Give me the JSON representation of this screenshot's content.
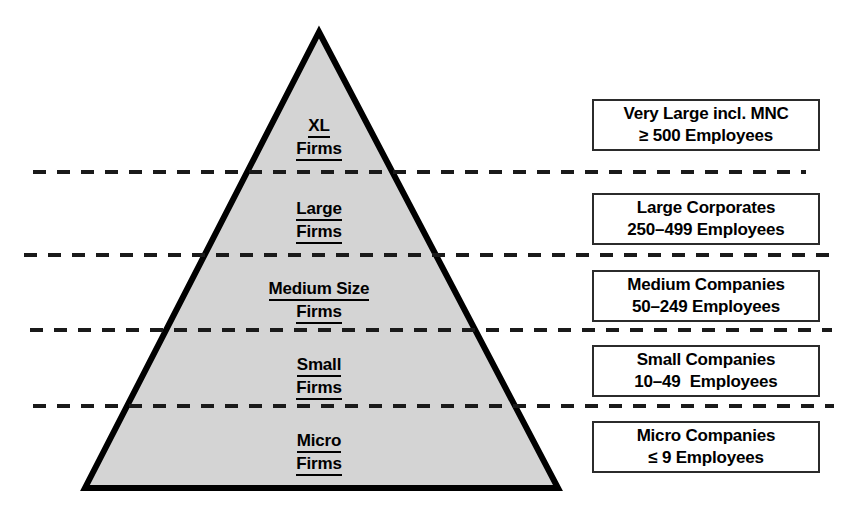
{
  "diagram": {
    "type": "pyramid",
    "colors": {
      "pyramid_fill": "#d4d4d4",
      "pyramid_outline": "#000000",
      "divider": "#1a1a1a",
      "box_border": "#2b2b2b",
      "box_fill": "#ffffff",
      "text": "#000000",
      "background": "#ffffff"
    },
    "tiers": [
      {
        "id": "xl",
        "label_line1": "XL",
        "label_line2": "Firms",
        "description_line1": "Very Large incl. MNC",
        "description_line2": "≥ 500 Employees"
      },
      {
        "id": "large",
        "label_line1": "Large",
        "label_line2": "Firms",
        "description_line1": "Large Corporates",
        "description_line2": "250–499 Employees"
      },
      {
        "id": "medium",
        "label_line1": "Medium Size",
        "label_line2": "Firms",
        "description_line1": "Medium Companies",
        "description_line2": "50–249 Employees"
      },
      {
        "id": "small",
        "label_line1": "Small",
        "label_line2": "Firms",
        "description_line1": "Small Companies",
        "description_line2": "10–49  Employees"
      },
      {
        "id": "micro",
        "label_line1": "Micro",
        "label_line2": "Firms",
        "description_line1": "Micro Companies",
        "description_line2": "≤ 9 Employees"
      }
    ]
  }
}
